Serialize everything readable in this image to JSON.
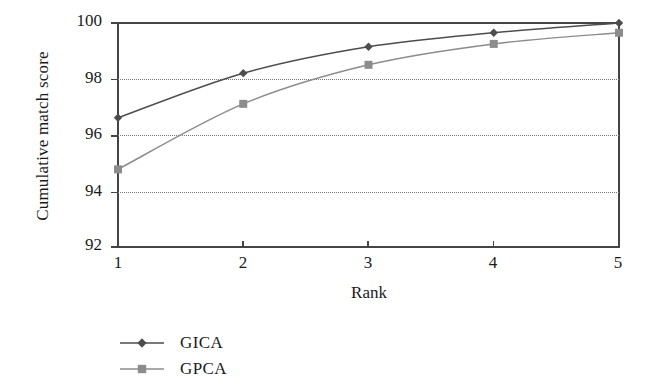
{
  "chart_data": {
    "type": "line",
    "title": "",
    "xlabel": "Rank",
    "ylabel": "Cumulative match score",
    "x": [
      1,
      2,
      3,
      4,
      5
    ],
    "xlim": [
      1,
      5
    ],
    "ylim": [
      92,
      100
    ],
    "xticks": [
      "1",
      "2",
      "3",
      "4",
      "5"
    ],
    "yticks": [
      "92",
      "94",
      "96",
      "98",
      "100"
    ],
    "grid": "horizontal-dotted",
    "legend_position": "below-left",
    "series": [
      {
        "name": "GICA",
        "marker": "diamond",
        "color": "#4d4d4d",
        "values": [
          96.6,
          98.2,
          99.15,
          99.65,
          100.0
        ]
      },
      {
        "name": "GPCA",
        "marker": "square",
        "color": "#8c8c8c",
        "values": [
          94.75,
          97.1,
          98.5,
          99.25,
          99.65
        ]
      }
    ]
  },
  "axes": {
    "ylabel": "Cumulative match score",
    "xlabel": "Rank",
    "ytick_labels": [
      "100",
      "98",
      "96",
      "94",
      "92"
    ],
    "xtick_labels": [
      "1",
      "2",
      "3",
      "4",
      "5"
    ]
  },
  "legend": {
    "items": [
      {
        "label": "GICA",
        "color": "#4d4d4d",
        "marker": "diamond"
      },
      {
        "label": "GPCA",
        "color": "#8c8c8c",
        "marker": "square"
      }
    ]
  },
  "colors": {
    "axis": "#444444",
    "grid": "#777777",
    "series_1": "#4d4d4d",
    "series_2": "#8c8c8c",
    "background": "#ffffff"
  }
}
